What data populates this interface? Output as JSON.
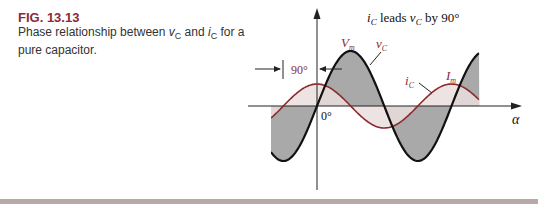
{
  "figure": {
    "number": "FIG. 13.13",
    "caption_prefix": "Phase relationship between ",
    "caption_v": "v",
    "caption_v_sub": "C",
    "caption_mid": " and ",
    "caption_i": "i",
    "caption_i_sub": "C",
    "caption_suffix": " for a pure capacitor."
  },
  "diagram": {
    "title_i": "i",
    "title_i_sub": "C",
    "title_mid": " leads ",
    "title_v": "v",
    "title_v_sub": "C",
    "title_suffix": " by 90°",
    "phase_label": "90°",
    "origin_label": "0°",
    "x_axis_label": "α",
    "label_Vm": "V",
    "label_Vm_sub": "m",
    "label_vC": "v",
    "label_vC_sub": "C",
    "label_iC": "i",
    "label_iC_sub": "C",
    "label_Im": "I",
    "label_Im_sub": "m",
    "colors": {
      "voltage_curve": "#111111",
      "voltage_fill": "#a9a9a9",
      "current_curve": "#8b2a2e",
      "current_fill": "#eadede",
      "label_accent": "#8b2a3a"
    }
  },
  "chart_data": {
    "type": "line",
    "xlabel": "α",
    "ylabel": "",
    "x_range_deg": [
      -125,
      425
    ],
    "series": [
      {
        "name": "v_C",
        "amplitude_label": "V_m",
        "function": "V_m sin(α)",
        "phase_deg": 0,
        "relative_amplitude": 1.0
      },
      {
        "name": "i_C",
        "amplitude_label": "I_m",
        "function": "I_m sin(α + 90°)",
        "phase_deg": 90,
        "relative_amplitude": 0.4
      }
    ],
    "annotations": [
      "90° phase shift",
      "0° at origin",
      "V_m",
      "I_m"
    ]
  }
}
